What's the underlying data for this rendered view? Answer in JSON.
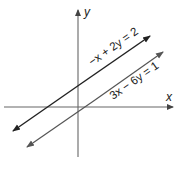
{
  "diagram": {
    "type": "coordinate-plane",
    "axes": {
      "x_label": "x",
      "y_label": "y",
      "color": "#666666"
    },
    "lines": [
      {
        "equation": "−x + 2y = 2",
        "color": "#222222",
        "role": "upper-line"
      },
      {
        "equation": "3x − 6y = 1",
        "color": "#555555",
        "role": "lower-line"
      }
    ]
  }
}
